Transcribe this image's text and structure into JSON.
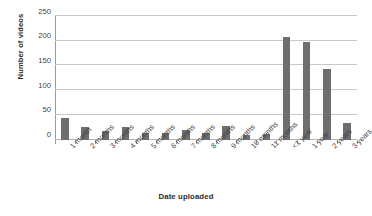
{
  "chart_data": {
    "type": "bar",
    "title": "",
    "xlabel": "Date uploaded",
    "ylabel": "Number of videos",
    "ylim": [
      0,
      250
    ],
    "yticks": [
      0,
      50,
      100,
      150,
      200,
      250
    ],
    "ytick_labels": [
      "0",
      "50",
      "100",
      "150",
      "200",
      "250"
    ],
    "grid": true,
    "legend": false,
    "bar_color": "#6e6e6e",
    "gridline_color": "#c8c8c8",
    "background_color": "#ffffff",
    "categories": [
      "1 month",
      "2 months",
      "3 months",
      "4 months",
      "5 months",
      "6 months",
      "7 months",
      "8 months",
      "9 months",
      "10 months",
      "11 months",
      "<1 year",
      "1 year",
      "2 years",
      "3 years"
    ],
    "values": [
      43,
      25,
      17,
      26,
      14,
      13,
      20,
      14,
      28,
      9,
      11,
      207,
      198,
      143,
      34
    ]
  }
}
